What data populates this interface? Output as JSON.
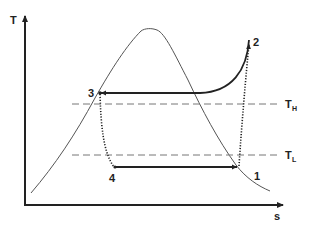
{
  "diagram": {
    "type": "T-s diagram (vapor-compression refrigeration cycle)",
    "axes": {
      "y_label": "T",
      "x_label": "s"
    },
    "points": [
      {
        "id": "1",
        "label": "1"
      },
      {
        "id": "2",
        "label": "2"
      },
      {
        "id": "3",
        "label": "3"
      },
      {
        "id": "4",
        "label": "4"
      }
    ],
    "reference_lines": [
      {
        "id": "TH",
        "label_main": "T",
        "label_sub": "H"
      },
      {
        "id": "TL",
        "label_main": "T",
        "label_sub": "L"
      }
    ],
    "processes": [
      {
        "from": "1",
        "to": "2",
        "style": "dotted"
      },
      {
        "from": "2",
        "to": "3",
        "style": "solid"
      },
      {
        "from": "3",
        "to": "4",
        "style": "dotted"
      },
      {
        "from": "4",
        "to": "1",
        "style": "solid-arrow"
      }
    ],
    "colors": {
      "line": "#222222",
      "dome": "#555555",
      "dashed": "#777777"
    }
  }
}
